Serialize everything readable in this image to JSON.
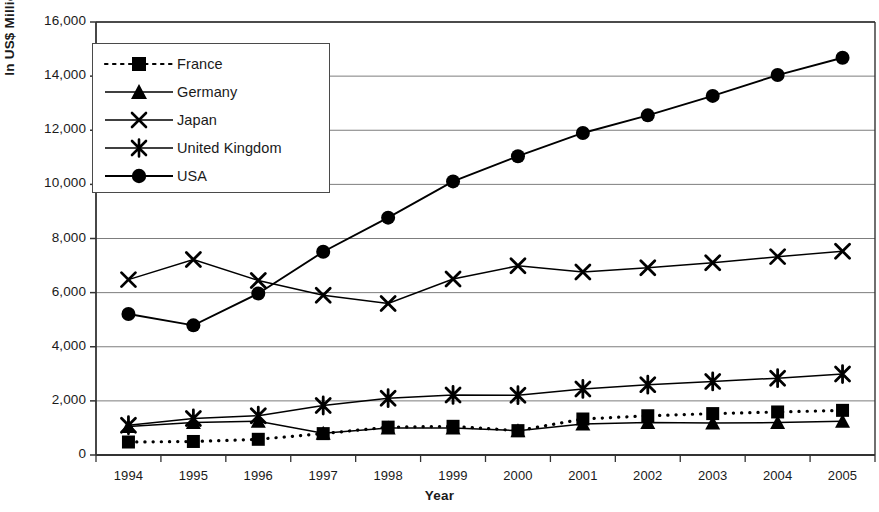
{
  "chart_data": {
    "type": "line",
    "title": "",
    "xlabel": "Year",
    "ylabel": "In US$ Million",
    "categories": [
      "1994",
      "1995",
      "1996",
      "1997",
      "1998",
      "1999",
      "2000",
      "2001",
      "2002",
      "2003",
      "2004",
      "2005"
    ],
    "ylim": [
      0,
      16000
    ],
    "ytick_step": 2000,
    "ytick_labels": [
      "0",
      "2,000",
      "4,000",
      "6,000",
      "8,000",
      "10,000",
      "12,000",
      "14,000",
      "16,000"
    ],
    "ytick_values": [
      0,
      2000,
      4000,
      6000,
      8000,
      10000,
      12000,
      14000,
      16000
    ],
    "grid": true,
    "legend_position": "top-left-inside",
    "series": [
      {
        "name": "France",
        "marker": "square",
        "line": "dotted",
        "color": "#000000",
        "values": [
          480,
          500,
          580,
          790,
          1030,
          1060,
          900,
          1330,
          1450,
          1530,
          1590,
          1650
        ]
      },
      {
        "name": "Germany",
        "marker": "triangle",
        "line": "solid",
        "color": "#000000",
        "values": [
          1050,
          1200,
          1250,
          800,
          1000,
          1000,
          900,
          1150,
          1200,
          1180,
          1200,
          1250
        ]
      },
      {
        "name": "Japan",
        "marker": "x",
        "line": "solid",
        "color": "#000000",
        "values": [
          6480,
          7220,
          6450,
          5900,
          5600,
          6500,
          6990,
          6760,
          6920,
          7100,
          7330,
          7530
        ]
      },
      {
        "name": "United Kingdom",
        "marker": "asterisk",
        "line": "solid",
        "color": "#000000",
        "values": [
          1100,
          1350,
          1450,
          1830,
          2100,
          2220,
          2210,
          2440,
          2600,
          2720,
          2840,
          2990
        ]
      },
      {
        "name": "USA",
        "marker": "circle",
        "line": "solid",
        "color": "#000000",
        "values": [
          5210,
          4790,
          5970,
          7510,
          8770,
          10110,
          11040,
          11900,
          12550,
          13270,
          14040,
          14680
        ]
      }
    ]
  },
  "legend": {
    "items": [
      {
        "label": "France"
      },
      {
        "label": "Germany"
      },
      {
        "label": "Japan"
      },
      {
        "label": "United Kingdom"
      },
      {
        "label": "USA"
      }
    ]
  },
  "axes": {
    "y_title": "In US$ Million",
    "x_title": "Year"
  }
}
